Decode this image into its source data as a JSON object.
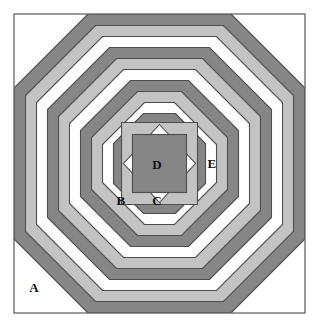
{
  "figure": {
    "canvas": {
      "width": 318,
      "height": 328
    },
    "frame": {
      "x": 14,
      "y": 14,
      "width": 291,
      "height": 299,
      "stroke_color": "#595959",
      "stroke_width": 1.2
    },
    "colors": {
      "dark_gray": "#868686",
      "light_gray": "#c3c3c3",
      "white": "#ffffff",
      "outline": "#4d4d4d",
      "label_text": "#111111",
      "background": "#ffffff"
    },
    "center": {
      "x": 159.5,
      "y": 163.5
    }
  },
  "rings": [
    {
      "index": 0,
      "name": "ring-outer-1",
      "half_width": 145.5,
      "half_height": 149.5,
      "chamfer": 74,
      "fill": "dark_gray"
    },
    {
      "index": 1,
      "name": "ring-outer-2",
      "half_width": 134.0,
      "half_height": 138.0,
      "chamfer": 70,
      "fill": "light_gray"
    },
    {
      "index": 2,
      "name": "ring-outer-3",
      "half_width": 123.0,
      "half_height": 127.0,
      "chamfer": 66,
      "fill": "white"
    },
    {
      "index": 3,
      "name": "ring-outer-4",
      "half_width": 112.0,
      "half_height": 116.0,
      "chamfer": 62,
      "fill": "dark_gray"
    },
    {
      "index": 4,
      "name": "ring-mid-1",
      "half_width": 101.0,
      "half_height": 105.0,
      "chamfer": 58,
      "fill": "light_gray"
    },
    {
      "index": 5,
      "name": "ring-mid-2",
      "half_width": 90.0,
      "half_height": 94.0,
      "chamfer": 54,
      "fill": "white"
    },
    {
      "index": 6,
      "name": "ring-mid-3",
      "half_width": 79.0,
      "half_height": 83.0,
      "chamfer": 50,
      "fill": "dark_gray"
    },
    {
      "index": 7,
      "name": "ring-mid-4",
      "half_width": 68.0,
      "half_height": 72.0,
      "chamfer": 46,
      "fill": "light_gray"
    },
    {
      "index": 8,
      "name": "ring-mid-5",
      "half_width": 57.0,
      "half_height": 61.0,
      "chamfer": 42,
      "fill": "white"
    },
    {
      "index": 9,
      "name": "ring-inner-1",
      "half_width": 46.0,
      "half_height": 50.0,
      "chamfer": 30,
      "fill": "dark_gray"
    },
    {
      "index": 10,
      "name": "ring-inner-2",
      "half_width": 38.0,
      "half_height": 41.0,
      "chamfer": 0,
      "fill": "light_gray"
    }
  ],
  "center_motif": {
    "diamond": {
      "name": "center-diamond",
      "radius_x": 36.0,
      "radius_y": 39.0,
      "fill": "white"
    },
    "square": {
      "name": "center-square",
      "half_width": 27.0,
      "half_height": 29.0,
      "fill": "dark_gray"
    }
  },
  "labels": [
    {
      "id": "A",
      "name": "region-label-a",
      "text": "A",
      "x": 34,
      "y": 287,
      "region": "outer dark corner"
    },
    {
      "id": "B",
      "name": "region-label-b",
      "text": "B",
      "x": 121,
      "y": 200,
      "region": "inner dark ring lower-left"
    },
    {
      "id": "C",
      "name": "region-label-c",
      "text": "C",
      "x": 157,
      "y": 200,
      "region": "white diamond lower point"
    },
    {
      "id": "D",
      "name": "region-label-d",
      "text": "D",
      "x": 157,
      "y": 164,
      "region": "central dark square"
    },
    {
      "id": "E",
      "name": "region-label-e",
      "text": "E",
      "x": 212,
      "y": 163,
      "region": "light gray vertical band right"
    }
  ]
}
